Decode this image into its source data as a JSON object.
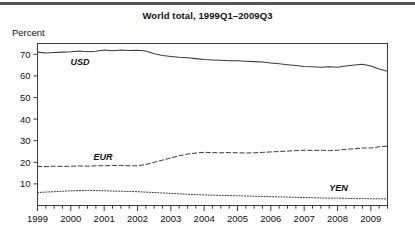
{
  "figure": {
    "title": "World total, 1999Q1–2009Q3",
    "unit_label": "Percent"
  },
  "chart_data": {
    "type": "line",
    "title": "World total, 1999Q1–2009Q3",
    "xlabel": "",
    "ylabel": "Percent",
    "ylim": [
      0,
      75
    ],
    "yticks": [
      10,
      20,
      30,
      40,
      50,
      60,
      70
    ],
    "xlim": [
      "1999Q1",
      "2009Q3"
    ],
    "xticks": [
      "1999",
      "2000",
      "2001",
      "2002",
      "2003",
      "2004",
      "2005",
      "2006",
      "2007",
      "2008",
      "2009"
    ],
    "grid": false,
    "legend_position": "inline-labels",
    "x": [
      "1999Q1",
      "1999Q2",
      "1999Q3",
      "1999Q4",
      "2000Q1",
      "2000Q2",
      "2000Q3",
      "2000Q4",
      "2001Q1",
      "2001Q2",
      "2001Q3",
      "2001Q4",
      "2002Q1",
      "2002Q2",
      "2002Q3",
      "2002Q4",
      "2003Q1",
      "2003Q2",
      "2003Q3",
      "2003Q4",
      "2004Q1",
      "2004Q2",
      "2004Q3",
      "2004Q4",
      "2005Q1",
      "2005Q2",
      "2005Q3",
      "2005Q4",
      "2006Q1",
      "2006Q2",
      "2006Q3",
      "2006Q4",
      "2007Q1",
      "2007Q2",
      "2007Q3",
      "2007Q4",
      "2008Q1",
      "2008Q2",
      "2008Q3",
      "2008Q4",
      "2009Q1",
      "2009Q2",
      "2009Q3"
    ],
    "series": [
      {
        "name": "USD",
        "label": "USD",
        "style": "solid",
        "values": [
          71.0,
          70.6,
          70.8,
          71.0,
          71.2,
          71.5,
          71.2,
          71.4,
          72.0,
          71.6,
          72.0,
          71.8,
          71.9,
          71.5,
          70.3,
          69.4,
          69.0,
          68.6,
          68.4,
          68.0,
          67.6,
          67.4,
          67.2,
          67.0,
          67.0,
          66.8,
          66.6,
          66.4,
          66.0,
          65.6,
          65.2,
          64.8,
          64.4,
          64.2,
          64.0,
          64.2,
          64.0,
          64.6,
          65.0,
          65.4,
          64.6,
          63.2,
          62.2
        ]
      },
      {
        "name": "EUR",
        "label": "EUR",
        "style": "dashed",
        "values": [
          18.1,
          18.0,
          18.2,
          18.1,
          18.2,
          18.3,
          18.2,
          18.4,
          18.4,
          18.5,
          18.6,
          18.4,
          18.4,
          19.0,
          20.0,
          21.0,
          22.0,
          23.0,
          23.8,
          24.3,
          24.6,
          24.5,
          24.4,
          24.5,
          24.4,
          24.3,
          24.4,
          24.6,
          24.8,
          25.0,
          25.2,
          25.4,
          25.6,
          25.5,
          25.6,
          25.4,
          25.6,
          26.0,
          26.3,
          26.6,
          26.6,
          27.2,
          27.5
        ]
      },
      {
        "name": "YEN",
        "label": "YEN",
        "style": "dotted",
        "values": [
          6.0,
          6.2,
          6.4,
          6.6,
          6.8,
          6.9,
          7.0,
          6.9,
          6.8,
          6.7,
          6.6,
          6.5,
          6.4,
          6.2,
          6.0,
          5.8,
          5.6,
          5.4,
          5.2,
          5.0,
          4.9,
          4.8,
          4.7,
          4.6,
          4.5,
          4.4,
          4.3,
          4.2,
          4.1,
          4.0,
          3.9,
          3.8,
          3.7,
          3.6,
          3.5,
          3.4,
          3.4,
          3.3,
          3.2,
          3.2,
          3.1,
          3.1,
          3.0
        ]
      }
    ],
    "annotations": [
      {
        "text": "USD",
        "series": "USD"
      },
      {
        "text": "EUR",
        "series": "EUR"
      },
      {
        "text": "YEN",
        "series": "YEN"
      }
    ]
  }
}
